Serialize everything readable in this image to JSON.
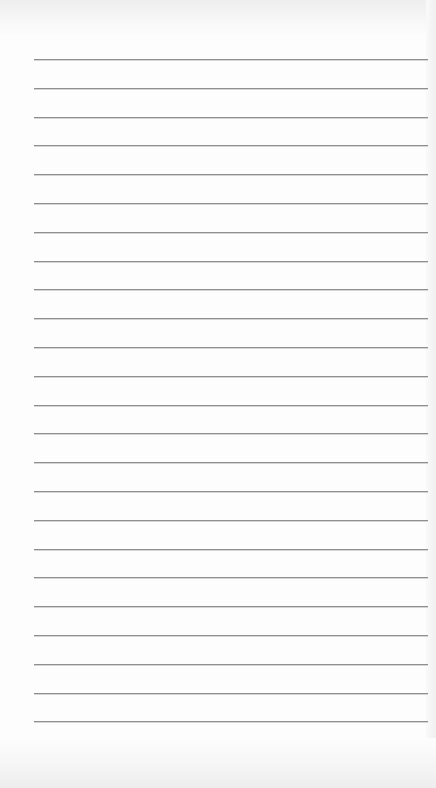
{
  "notepad": {
    "style": "lined-paper",
    "line_color": "#8f8f8f",
    "background_color": "#fdfdfd",
    "first_line_y": 59,
    "line_spacing": 28.8,
    "line_count": 24,
    "line_left": 34,
    "line_width": 394,
    "lines": [
      "",
      "",
      "",
      "",
      "",
      "",
      "",
      "",
      "",
      "",
      "",
      "",
      "",
      "",
      "",
      "",
      "",
      "",
      "",
      "",
      "",
      "",
      "",
      ""
    ]
  }
}
